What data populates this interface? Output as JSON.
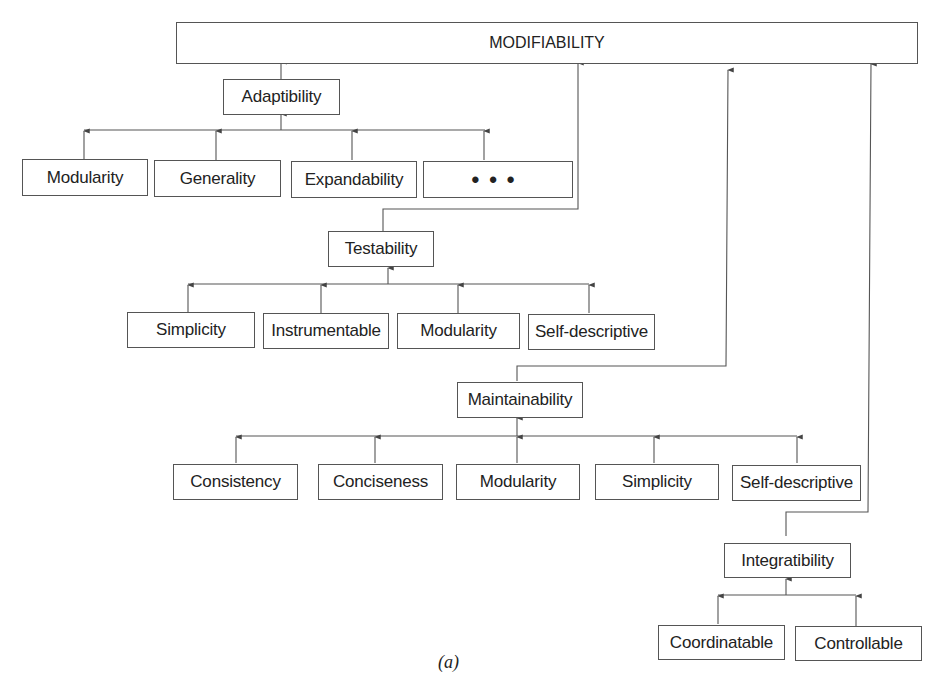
{
  "diagram": {
    "root": {
      "label": "MODIFIABILITY"
    },
    "groups": [
      {
        "parent": "Adaptibility",
        "children": [
          "Modularity",
          "Generality",
          "Expandability",
          "•••"
        ]
      },
      {
        "parent": "Testability",
        "children": [
          "Simplicity",
          "Instrumentable",
          "Modularity",
          "Self-descriptive"
        ]
      },
      {
        "parent": "Maintainability",
        "children": [
          "Consistency",
          "Conciseness",
          "Modularity",
          "Simplicity",
          "Self-descriptive"
        ]
      },
      {
        "parent": "Integratibility",
        "children": [
          "Coordinatable",
          "Controllable"
        ]
      }
    ],
    "caption": "(a)",
    "colors": {
      "line": "#555555",
      "text": "#222222",
      "background": "#ffffff"
    }
  }
}
